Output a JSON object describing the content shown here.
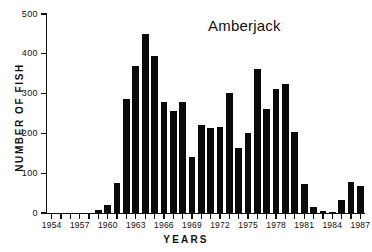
{
  "chart_data": {
    "type": "bar",
    "title": "Amberjack",
    "xlabel": "YEARS",
    "ylabel": "NUMBER OF FISH",
    "ylim": [
      0,
      500
    ],
    "xlim": [
      1953.5,
      1987.5
    ],
    "ytick_values": [
      0,
      100,
      200,
      300,
      400,
      500
    ],
    "ytick_labels": [
      "0",
      "100",
      "200",
      "300",
      "400",
      "500"
    ],
    "xtick_labels": [
      "1954",
      "1957",
      "1960",
      "1963",
      "1966",
      "1969",
      "1972",
      "1975",
      "1978",
      "1981",
      "1984",
      "1987"
    ],
    "xtick_label_values": [
      1954,
      1957,
      1960,
      1963,
      1966,
      1969,
      1972,
      1975,
      1978,
      1981,
      1984,
      1987
    ],
    "xtick_minor_values": [
      1954,
      1955,
      1956,
      1957,
      1958,
      1959,
      1960,
      1961,
      1962,
      1963,
      1964,
      1965,
      1966,
      1967,
      1968,
      1969,
      1970,
      1971,
      1972,
      1973,
      1974,
      1975,
      1976,
      1977,
      1978,
      1979,
      1980,
      1981,
      1982,
      1983,
      1984,
      1985,
      1986,
      1987
    ],
    "grid": false,
    "legend": false,
    "bar_color": "#0a0a0a",
    "axis_color": "#111111",
    "background": "#ffffff",
    "categories": [
      1954,
      1955,
      1956,
      1957,
      1958,
      1959,
      1960,
      1961,
      1962,
      1963,
      1964,
      1965,
      1966,
      1967,
      1968,
      1969,
      1970,
      1971,
      1972,
      1973,
      1974,
      1975,
      1976,
      1977,
      1978,
      1979,
      1980,
      1981,
      1982,
      1983,
      1984,
      1985,
      1986,
      1987
    ],
    "values": [
      0,
      0,
      0,
      0,
      0,
      8,
      20,
      75,
      287,
      370,
      450,
      395,
      278,
      257,
      280,
      140,
      220,
      213,
      215,
      301,
      163,
      202,
      363,
      261,
      311,
      324,
      203,
      73,
      15,
      5,
      2,
      33,
      79,
      67
    ],
    "series": [
      {
        "name": "Amberjack",
        "values": [
          0,
          0,
          0,
          0,
          0,
          8,
          20,
          75,
          287,
          370,
          450,
          395,
          278,
          257,
          280,
          140,
          220,
          213,
          215,
          301,
          163,
          202,
          363,
          261,
          311,
          324,
          203,
          73,
          15,
          5,
          2,
          33,
          79,
          67
        ]
      }
    ]
  }
}
